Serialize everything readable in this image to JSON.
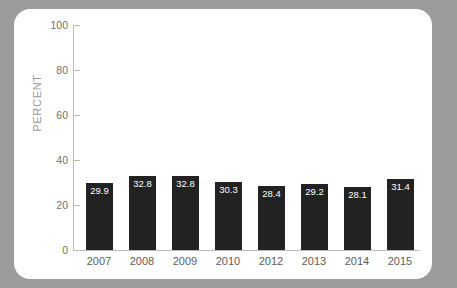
{
  "chart_data": {
    "type": "bar",
    "title": "",
    "subtitle": "",
    "xlabel": "",
    "ylabel": "PERCENT",
    "categories": [
      "2007",
      "2008",
      "2009",
      "2010",
      "2012",
      "2013",
      "2014",
      "2015"
    ],
    "values": [
      29.9,
      32.8,
      32.8,
      30.3,
      28.4,
      29.2,
      28.1,
      31.4
    ],
    "value_labels": [
      "29.9",
      "32.8",
      "32.8",
      "30.3",
      "28.4",
      "29.2",
      "28.1",
      "31.4"
    ],
    "ylim": [
      0,
      100
    ],
    "yticks": [
      0,
      20,
      40,
      60,
      80,
      100
    ],
    "ytick_labels": [
      "0",
      "20",
      "40",
      "60",
      "80",
      "100"
    ],
    "grid": false,
    "legend": null,
    "legend_position": "none",
    "bar_color": "#222222",
    "value_label_color": "#ffffff",
    "axis_color": "#b9b9b9",
    "tick_label_color": "#6f6f6f",
    "axis_title_color": "#9b9b9b",
    "card_background": "#ffffff",
    "page_background": "#9c9c9c"
  }
}
